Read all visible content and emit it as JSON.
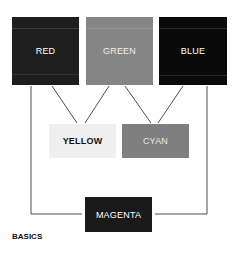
{
  "diagram": {
    "caption": "BASICS",
    "nodes": [
      {
        "id": "red",
        "label": "RED",
        "bg": "#1e1e1e",
        "fg": "#ffffff"
      },
      {
        "id": "green",
        "label": "GREEN",
        "bg": "#858585",
        "fg": "#f0f0f0"
      },
      {
        "id": "blue",
        "label": "BLUE",
        "bg": "#0a0a0a",
        "fg": "#ffffff"
      },
      {
        "id": "yellow",
        "label": "YELLOW",
        "bg": "#efefef",
        "fg": "#111111"
      },
      {
        "id": "cyan",
        "label": "CYAN",
        "bg": "#7f7f7f",
        "fg": "#e8e8e8"
      },
      {
        "id": "magenta",
        "label": "MAGENTA",
        "bg": "#1a1a1a",
        "fg": "#ffffff"
      }
    ],
    "edges": [
      {
        "from": "red",
        "to": "yellow"
      },
      {
        "from": "green",
        "to": "yellow"
      },
      {
        "from": "green",
        "to": "cyan"
      },
      {
        "from": "blue",
        "to": "cyan"
      },
      {
        "from": "red",
        "to": "magenta"
      },
      {
        "from": "blue",
        "to": "magenta"
      }
    ]
  }
}
